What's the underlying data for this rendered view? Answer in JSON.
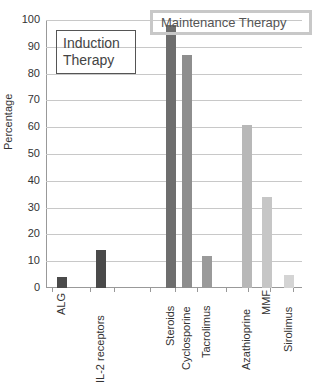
{
  "chart_data": {
    "type": "bar",
    "title": "",
    "xlabel": "",
    "ylabel": "Percentage",
    "ylim": [
      0,
      100
    ],
    "yticks": [
      0,
      10,
      20,
      30,
      40,
      50,
      60,
      70,
      80,
      90,
      100
    ],
    "grid": true,
    "categories": [
      "ALG",
      "IL-2 receptors",
      "Steroids",
      "Cyclosporine",
      "Tacrolimus",
      "Azathioprine",
      "MMF",
      "Sirolimus"
    ],
    "values": [
      4,
      14,
      98,
      87,
      12,
      61,
      34,
      5
    ],
    "groups": [
      {
        "name": "Induction Therapy",
        "categories": [
          "ALG",
          "IL-2 receptors"
        ]
      },
      {
        "name": "Maintenance Therapy",
        "categories": [
          "Steroids",
          "Cyclosporine",
          "Tacrolimus",
          "Azathioprine",
          "MMF",
          "Sirolimus"
        ]
      }
    ],
    "colors": [
      "#4a4a4a",
      "#4a4a4a",
      "#6e6e6e",
      "#8e8e8e",
      "#9a9a9a",
      "#b8b8b8",
      "#c6c6c6",
      "#d4d4d4"
    ],
    "annotations": [
      "Induction Therapy",
      "Maintenance Therapy"
    ]
  },
  "labels": {
    "ylabel": "Percentage",
    "induction": "Induction Therapy",
    "maintenance": "Maintenance Therapy",
    "yticks": [
      "0",
      "10",
      "20",
      "30",
      "40",
      "50",
      "60",
      "70",
      "80",
      "90",
      "100"
    ],
    "categories": [
      "ALG",
      "IL-2 receptors",
      "Steroids",
      "Cyclosporine",
      "Tacrolimus",
      "Azathioprine",
      "MMF",
      "Sirolimus"
    ]
  }
}
